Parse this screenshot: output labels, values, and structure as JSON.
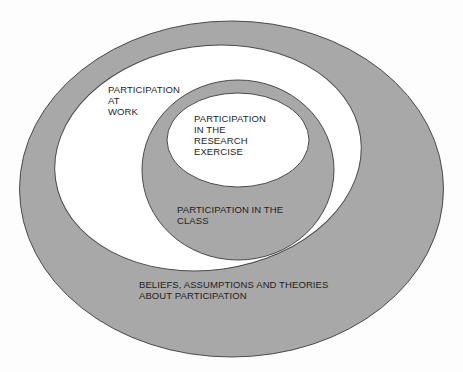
{
  "diagram": {
    "type": "nested-ellipses",
    "colors": {
      "background": "#fdfdfd",
      "band_fill": "#a8a8a8",
      "inner_fill": "#ffffff",
      "stroke": "#4a4a4a",
      "text": "#1e1e1e"
    },
    "regions": [
      {
        "id": "beliefs",
        "lines": [
          "BELIEFS, ASSUMPTIONS AND THEORIES",
          "ABOUT PARTICIPATION"
        ]
      },
      {
        "id": "work",
        "lines": [
          "PARTICIPATION",
          "AT",
          "WORK"
        ]
      },
      {
        "id": "class",
        "lines": [
          "PARTICIPATION IN THE",
          "CLASS"
        ]
      },
      {
        "id": "research",
        "lines": [
          "PARTICIPATION",
          "IN THE",
          "RESEARCH",
          "EXERCISE"
        ]
      }
    ]
  }
}
